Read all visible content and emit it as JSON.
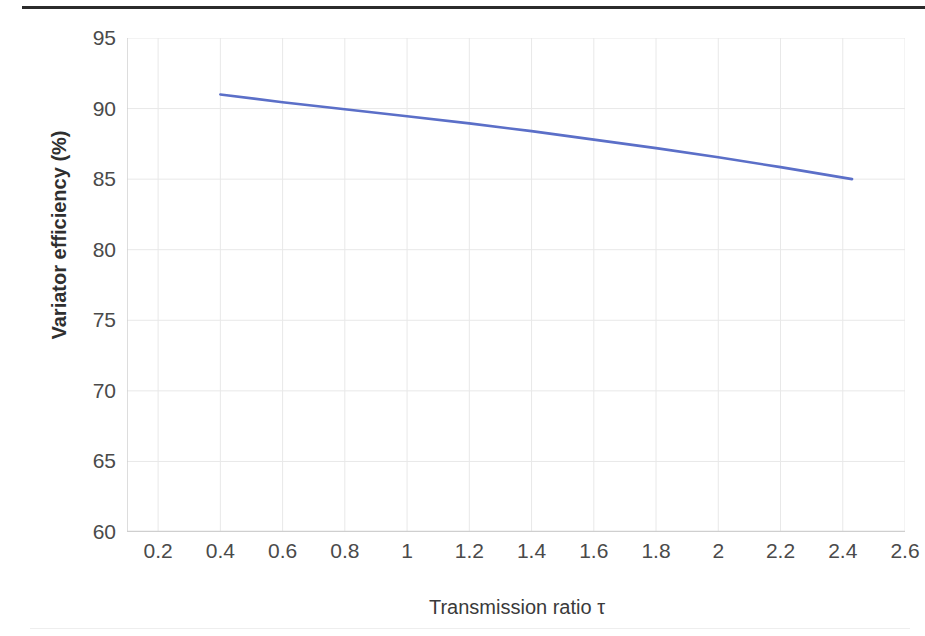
{
  "credit": "© Dana Rexroth",
  "chart_data": {
    "type": "line",
    "title": "",
    "subtitle": "",
    "xlabel": "Transmission ratio τ",
    "ylabel": "Variator efficiency (%)",
    "xlim": [
      0.1,
      2.6
    ],
    "ylim": [
      60,
      95
    ],
    "grid": true,
    "legend_position": "none",
    "line_color": "#5b6fc8",
    "axis_color": "#d9d9d9",
    "grid_color": "#e8e8e8",
    "tick_color": "#4a4a4a",
    "xticks": [
      0.2,
      0.4,
      0.6,
      0.8,
      1,
      1.2,
      1.4,
      1.6,
      1.8,
      2,
      2.2,
      2.4,
      2.6
    ],
    "xtick_labels": [
      "0.2",
      "0.4",
      "0.6",
      "0.8",
      "1",
      "1.2",
      "1.4",
      "1.6",
      "1.8",
      "2",
      "2.2",
      "2.4",
      "2.6"
    ],
    "yticks": [
      60,
      65,
      70,
      75,
      80,
      85,
      90,
      95
    ],
    "ytick_labels": [
      "60",
      "65",
      "70",
      "75",
      "80",
      "85",
      "90",
      "95"
    ],
    "series": [
      {
        "name": "Variator efficiency",
        "x": [
          0.4,
          0.6,
          0.8,
          1.0,
          1.2,
          1.4,
          1.6,
          1.8,
          2.0,
          2.2,
          2.43
        ],
        "y": [
          91.0,
          90.45,
          89.95,
          89.45,
          88.95,
          88.4,
          87.8,
          87.2,
          86.55,
          85.85,
          85.0
        ]
      }
    ],
    "annotations": []
  }
}
